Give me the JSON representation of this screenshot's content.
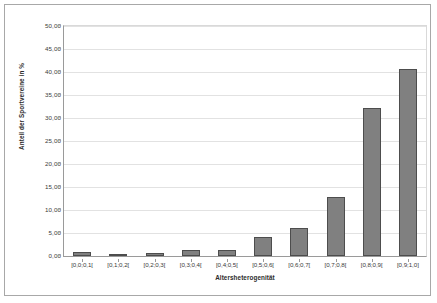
{
  "chart_data": {
    "type": "bar",
    "title": "",
    "xlabel": "Altersheterogenität",
    "ylabel": "Anteil der Sportvereine in %",
    "categories": [
      "[0,0;0,1[",
      "[0,1;0,2[",
      "[0,2;0,3[",
      "[0,3;0,4[",
      "[0,4;0,5[",
      "[0,5;0,6[",
      "[0,6;0,7[",
      "[0,7;0,8[",
      "[0,8;0,9[",
      "[0,9;1,0]"
    ],
    "values": [
      0.9,
      0.3,
      0.7,
      1.3,
      1.3,
      4.1,
      6.1,
      12.8,
      32.2,
      40.7
    ],
    "ylim": [
      0,
      50
    ],
    "ytick_labels": [
      "0,00",
      "5,00",
      "10,00",
      "15,00",
      "20,00",
      "25,00",
      "30,00",
      "35,00",
      "40,00",
      "45,00",
      "50,00"
    ],
    "ytick_values": [
      0,
      5,
      10,
      15,
      20,
      25,
      30,
      35,
      40,
      45,
      50
    ],
    "grid": true,
    "legend": false,
    "bar_color": "#808080",
    "bar_border_color": "#4d4d4d",
    "gridline_color": "#e2e2e2",
    "axis_color": "#9a9a9a",
    "frame_color": "#a8a8a8",
    "background": "#ffffff"
  }
}
